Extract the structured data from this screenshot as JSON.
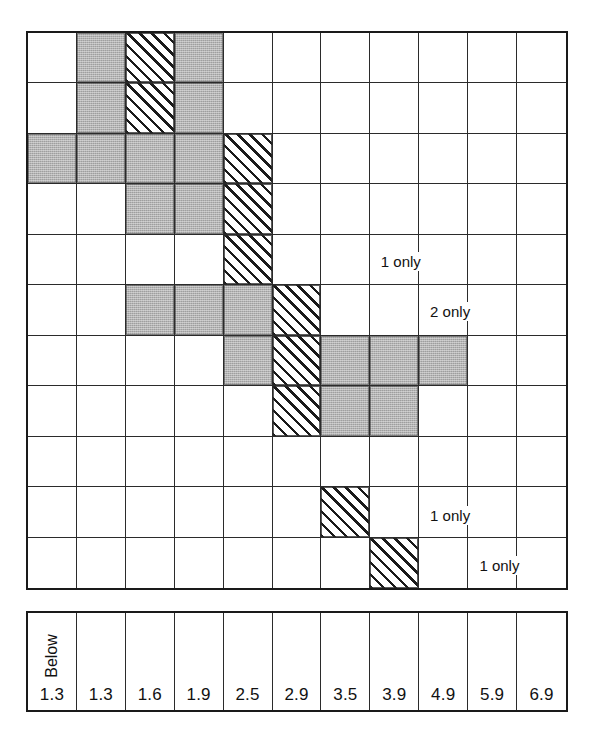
{
  "figure": {
    "type": "matrix-grid",
    "columns": 11,
    "rows": 11,
    "legend": {
      "gray_label": "shaded",
      "hatch_label": "hatched"
    }
  },
  "axis": {
    "prefix_label": "Below",
    "ticks": [
      "1.3",
      "1.3",
      "1.6",
      "1.9",
      "2.5",
      "2.9",
      "3.5",
      "3.9",
      "4.9",
      "5.9",
      "6.9"
    ]
  },
  "annotations": [
    {
      "text": "1 only",
      "row": 5,
      "col": 8
    },
    {
      "text": "2 only",
      "row": 6,
      "col": 9
    },
    {
      "text": "1 only",
      "row": 10,
      "col": 9
    },
    {
      "text": "1 only",
      "row": 11,
      "col": 10
    }
  ],
  "chart_data": {
    "type": "heatmap",
    "title": "",
    "xlabel": "",
    "ylabel": "",
    "grid": true,
    "legend_position": "none",
    "categories": [
      "1.3",
      "1.3",
      "1.6",
      "1.9",
      "2.5",
      "2.9",
      "3.5",
      "3.9",
      "4.9",
      "5.9",
      "6.9"
    ],
    "x_prefix_label": "Below",
    "fill_codes": {
      "0": "empty",
      "1": "gray",
      "2": "hatch"
    },
    "values": [
      [
        0,
        1,
        2,
        1,
        0,
        0,
        0,
        0,
        0,
        0,
        0
      ],
      [
        0,
        1,
        2,
        1,
        0,
        0,
        0,
        0,
        0,
        0,
        0
      ],
      [
        1,
        1,
        1,
        1,
        2,
        0,
        0,
        0,
        0,
        0,
        0
      ],
      [
        0,
        0,
        1,
        1,
        2,
        0,
        0,
        0,
        0,
        0,
        0
      ],
      [
        0,
        0,
        0,
        0,
        2,
        0,
        0,
        0,
        0,
        0,
        0
      ],
      [
        0,
        0,
        1,
        1,
        1,
        2,
        0,
        0,
        0,
        0,
        0
      ],
      [
        0,
        0,
        0,
        0,
        1,
        2,
        1,
        1,
        1,
        0,
        0
      ],
      [
        0,
        0,
        0,
        0,
        0,
        2,
        1,
        1,
        0,
        0,
        0
      ],
      [
        0,
        0,
        0,
        0,
        0,
        0,
        0,
        0,
        0,
        0,
        0
      ],
      [
        0,
        0,
        0,
        0,
        0,
        0,
        2,
        0,
        0,
        0,
        0
      ],
      [
        0,
        0,
        0,
        0,
        0,
        0,
        0,
        2,
        0,
        0,
        0
      ]
    ],
    "annotations": [
      {
        "text": "1 only",
        "row": 5,
        "col": 8
      },
      {
        "text": "2 only",
        "row": 6,
        "col": 9
      },
      {
        "text": "1 only",
        "row": 10,
        "col": 9
      },
      {
        "text": "1 only",
        "row": 11,
        "col": 10
      }
    ],
    "colors": {
      "gray": "#b3b3b3",
      "hatch": "#1a1a1a",
      "empty": "#ffffff",
      "grid_line": "#2b2b2b"
    }
  }
}
